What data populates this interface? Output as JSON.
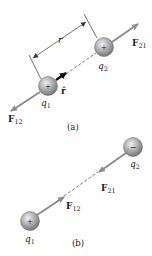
{
  "panel_a": {
    "caption": "(a)",
    "q1_label": "q",
    "q1_sub": "1",
    "q2_label": "q",
    "q2_sub": "2",
    "q1_sign": "+",
    "q2_sign": "+",
    "f12_label": "F",
    "f12_sub": "12",
    "f21_label": "F",
    "f21_sub": "21",
    "r_label": "r",
    "rhat_label": "r̂"
  },
  "panel_b": {
    "caption": "(b)",
    "q1_label": "q",
    "q1_sub": "1",
    "q2_label": "q",
    "q2_sub": "2",
    "q1_sign": "+",
    "q2_sign": "−",
    "f12_label": "F",
    "f12_sub": "12",
    "f21_label": "F",
    "f21_sub": "21"
  },
  "colors": {
    "sphere_light": "#e6e6e6",
    "sphere_dark": "#7a7a7a",
    "force_arrow": "#8c8c8c",
    "line": "#333333",
    "text": "#222222"
  }
}
